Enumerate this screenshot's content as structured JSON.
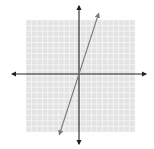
{
  "chart_data": {
    "type": "line",
    "title": "",
    "xlabel": "",
    "ylabel": "",
    "grid": true,
    "grid_cells": 20,
    "xlim": [
      -10,
      10
    ],
    "ylim": [
      -10,
      10
    ],
    "axes_arrows": true,
    "series": [
      {
        "name": "line",
        "equation": "y = 3x",
        "x": [
          -3.6,
          3.6
        ],
        "y": [
          -10.8,
          10.8
        ],
        "color": "#7a7a7a",
        "arrows_both_ends": true
      }
    ],
    "colors": {
      "grid_fill": "#e3e3e3",
      "grid_line": "#f7f7f7",
      "axis": "#222222",
      "line": "#7a7a7a"
    }
  }
}
